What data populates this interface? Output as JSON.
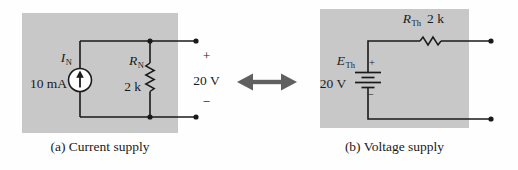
{
  "colors": {
    "box_gray": "#c8c8c8",
    "arrow_gray": "#606060",
    "ink": "#1a1a1a",
    "source_fill": "#ffffff"
  },
  "panel_a": {
    "caption": "(a) Current supply",
    "source": {
      "symbol": "I",
      "subscript": "N",
      "value": "10 mA"
    },
    "resistor": {
      "symbol": "R",
      "subscript": "N",
      "value": "2 k"
    },
    "terminal": {
      "plus": "+",
      "voltage": "20 V",
      "minus": "−"
    }
  },
  "panel_b": {
    "caption": "(b) Voltage supply",
    "resistor": {
      "symbol": "R",
      "subscript": "Th",
      "value": "2 k"
    },
    "source": {
      "symbol": "E",
      "subscript": "Th",
      "value": "20 V"
    },
    "battery": {
      "plus": "+",
      "minus": "−"
    }
  }
}
